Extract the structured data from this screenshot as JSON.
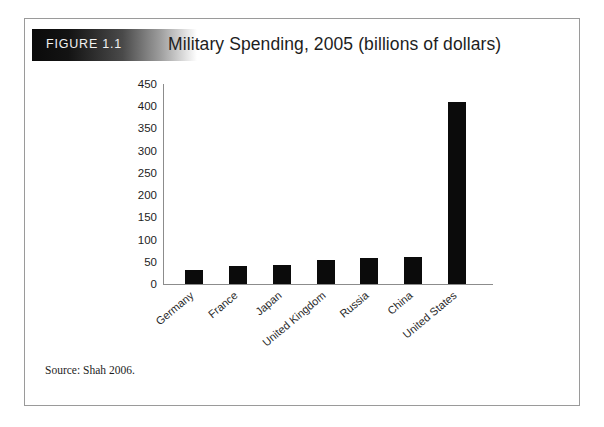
{
  "figure": {
    "label": "FIGURE 1.1",
    "title": "Military Spending, 2005 (billions of dollars)",
    "source": "Source: Shah 2006.",
    "frame_border_color": "#9a9a9a",
    "bar_color": "#0b0b0b",
    "axis_color": "#8c8c8c",
    "header_gradient_from": "#0a0a0a",
    "header_gradient_to": "#ffffff",
    "label_text_color": "#f2f2f2"
  },
  "chart_data": {
    "type": "bar",
    "title": "Military Spending, 2005 (billions of dollars)",
    "xlabel": "",
    "ylabel": "",
    "categories": [
      "Germany",
      "France",
      "Japan",
      "United Kingdom",
      "Russia",
      "China",
      "United States"
    ],
    "values": [
      32,
      40,
      42,
      55,
      58,
      60,
      410
    ],
    "ylim": [
      0,
      450
    ],
    "ytick_labels": [
      "450",
      "400",
      "350",
      "300",
      "250",
      "200",
      "150",
      "100",
      "50",
      "0"
    ],
    "ytick_values": [
      450,
      400,
      350,
      300,
      250,
      200,
      150,
      100,
      50,
      0
    ],
    "ytick_step": 50,
    "grid": false,
    "legend": false,
    "orientation": "vertical",
    "category_label_rotation_deg": -40,
    "units": "billions of dollars",
    "year": 2005
  }
}
